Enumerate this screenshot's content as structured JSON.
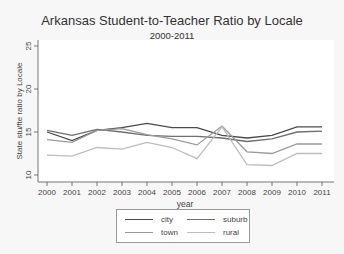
{
  "chart_data": {
    "type": "line",
    "title": "Arkansas Student-to-Teacher Ratio by Locale",
    "subtitle": "2000-2011",
    "xlabel": "year",
    "ylabel": "State stu/fte ratio by Locale",
    "x": [
      2000,
      2001,
      2002,
      2003,
      2004,
      2005,
      2006,
      2007,
      2008,
      2009,
      2010,
      2011
    ],
    "ylim": [
      10,
      25
    ],
    "yticks": [
      10,
      15,
      20,
      25
    ],
    "grid": false,
    "legend_position": "bottom",
    "series": [
      {
        "name": "city",
        "color": "#4a4a4a",
        "values": [
          15.0,
          14.0,
          15.2,
          15.5,
          16.0,
          15.5,
          15.5,
          14.6,
          14.3,
          14.6,
          15.6,
          15.6
        ]
      },
      {
        "name": "suburb",
        "color": "#6e6e6e",
        "values": [
          15.2,
          14.6,
          15.3,
          15.0,
          14.6,
          14.5,
          14.5,
          14.3,
          13.9,
          14.2,
          15.0,
          15.1
        ]
      },
      {
        "name": "town",
        "color": "#9a9a9a",
        "values": [
          14.1,
          13.8,
          15.2,
          15.4,
          14.7,
          14.2,
          13.5,
          15.7,
          12.7,
          12.5,
          13.6,
          13.6
        ]
      },
      {
        "name": "rural",
        "color": "#bdbdbd",
        "values": [
          12.3,
          12.2,
          13.2,
          13.0,
          13.8,
          13.2,
          11.9,
          15.6,
          11.2,
          11.1,
          12.5,
          12.5
        ]
      }
    ]
  },
  "legend": {
    "items": [
      {
        "label": "city",
        "color": "#4a4a4a"
      },
      {
        "label": "suburb",
        "color": "#6e6e6e"
      },
      {
        "label": "town",
        "color": "#9a9a9a"
      },
      {
        "label": "rural",
        "color": "#bdbdbd"
      }
    ]
  }
}
